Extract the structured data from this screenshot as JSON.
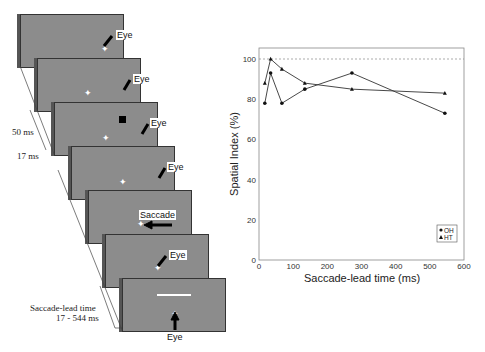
{
  "left_panel": {
    "eye_label": "Eye",
    "saccade_label": "Saccade",
    "time_50": "50 ms",
    "time_17": "17 ms",
    "lead_label_1": "Saccade-lead time",
    "lead_label_2": "17 - 544 ms"
  },
  "chart_data": {
    "type": "line",
    "title": "",
    "xlabel": "Saccade-lead time (ms)",
    "ylabel": "Spatial Index (%)",
    "xlim": [
      0,
      600
    ],
    "ylim": [
      0,
      100
    ],
    "xticks": [
      0,
      100,
      200,
      300,
      400,
      500,
      600
    ],
    "yticks": [
      0,
      20,
      40,
      60,
      80,
      100
    ],
    "reference_line": 100,
    "legend_position": "lower right",
    "series": [
      {
        "name": "OH",
        "marker": "circle",
        "x": [
          17,
          34,
          67,
          134,
          272,
          544
        ],
        "values": [
          78,
          93,
          78,
          85,
          93,
          73
        ]
      },
      {
        "name": "HT",
        "marker": "triangle",
        "x": [
          17,
          34,
          67,
          134,
          272,
          544
        ],
        "values": [
          88,
          100,
          95,
          88,
          85,
          83
        ]
      }
    ]
  }
}
